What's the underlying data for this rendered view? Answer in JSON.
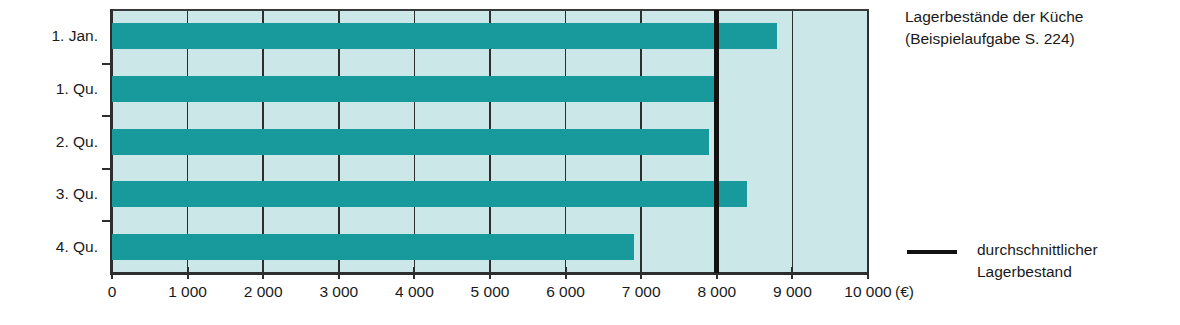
{
  "chart_data": {
    "type": "bar",
    "orientation": "horizontal",
    "title": "Lagerbestände der Küche",
    "subtitle": "(Beispielaufgabe S. 224)",
    "categories": [
      "1. Jan.",
      "1. Qu.",
      "2. Qu.",
      "3. Qu.",
      "4. Qu."
    ],
    "values": [
      8800,
      8000,
      7900,
      8400,
      6900
    ],
    "xlabel": "(€)",
    "ylabel": "",
    "xlim": [
      0,
      10000
    ],
    "xticks": [
      0,
      1000,
      2000,
      3000,
      4000,
      5000,
      6000,
      7000,
      8000,
      9000,
      10000
    ],
    "xtick_labels": [
      "0",
      "1 000",
      "2 000",
      "3 000",
      "4 000",
      "5 000",
      "6 000",
      "7 000",
      "8 000",
      "9 000",
      "10 000"
    ],
    "grid": true,
    "legend_position": "right",
    "series": [
      {
        "name": "Lagerbestand",
        "values": [
          8800,
          8000,
          7900,
          8400,
          6900
        ]
      }
    ],
    "reference_line": {
      "value": 8000,
      "label_line1": "durchschnittlicher",
      "label_line2": "Lagerbestand",
      "color": "#111111"
    },
    "colors": {
      "bar": "#189a9c",
      "plot_background": "#cce7e8",
      "axis": "#2e2e2e",
      "gridline": "#2e2e2e",
      "average_line": "#111111",
      "text": "#1a1a1a"
    }
  },
  "legend": {
    "line1": "durchschnittlicher",
    "line2": "Lagerbestand"
  },
  "title": {
    "line1": "Lagerbestände der Küche",
    "line2": "(Beispielaufgabe S. 224)"
  },
  "axis": {
    "unit": "(€)"
  }
}
